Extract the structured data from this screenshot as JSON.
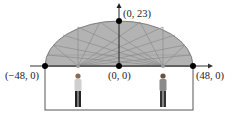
{
  "diagram": {
    "points": {
      "top": "(0, 23)",
      "center": "(0, 0)",
      "left": "(−48, 0)",
      "right": "(48, 0)"
    },
    "semi_major": 48,
    "semi_minor": 23,
    "figures": [
      "person-at-left-focus",
      "person-at-right-focus"
    ],
    "colors": {
      "fill": "#b3b3b3",
      "outline": "#555555",
      "reflection_lines": "#8c8c8c",
      "points": "#000000"
    }
  }
}
